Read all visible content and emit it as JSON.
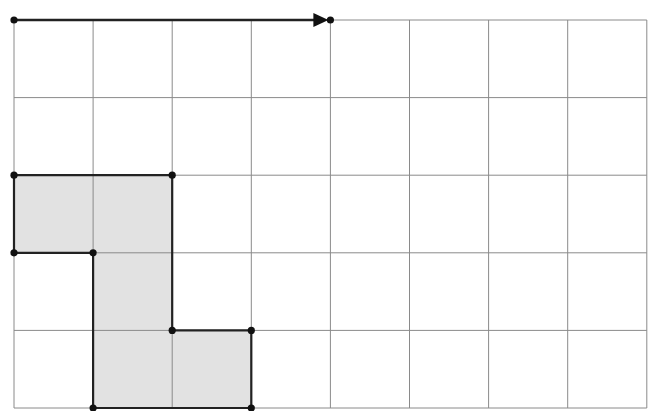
{
  "diagram": {
    "type": "grid-translation",
    "grid": {
      "columns": 8,
      "rows": 5,
      "line_color": "#8a8a8a"
    },
    "colors": {
      "shape_fill": "#e2e2e2",
      "outline": "#222222",
      "point": "#111111",
      "background": "#ffffff"
    },
    "translation_vector": {
      "from": [
        0,
        0
      ],
      "to": [
        4,
        0
      ],
      "description": "arrow 4 units right along top edge"
    },
    "shape": {
      "description": "shaded polygon made of 5 unit squares",
      "vertices": [
        [
          0,
          2
        ],
        [
          2,
          2
        ],
        [
          2,
          4
        ],
        [
          3,
          4
        ],
        [
          3,
          5
        ],
        [
          1,
          5
        ],
        [
          1,
          3
        ],
        [
          0,
          3
        ]
      ],
      "cells": [
        [
          0,
          2
        ],
        [
          1,
          2
        ],
        [
          1,
          3
        ],
        [
          1,
          4
        ],
        [
          2,
          4
        ]
      ]
    }
  }
}
